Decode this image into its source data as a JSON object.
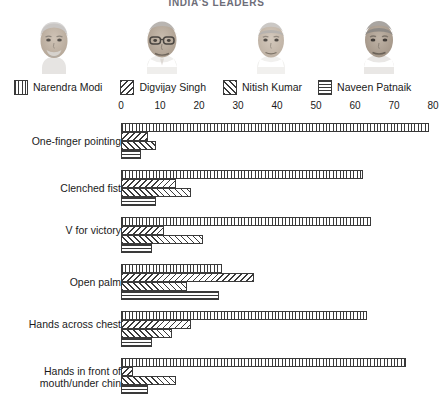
{
  "chart_title": "INDIA'S LEADERS",
  "legend": {
    "items": [
      {
        "label": "Narendra Modi",
        "pattern": "vertical-lines",
        "swatch_name": "legend-swatch-modi"
      },
      {
        "label": "Digvijay Singh",
        "pattern": "backslash-hatch",
        "swatch_name": "legend-swatch-singh"
      },
      {
        "label": "Nitish Kumar",
        "pattern": "forwardslash-hatch",
        "swatch_name": "legend-swatch-kumar"
      },
      {
        "label": "Naveen Patnaik",
        "pattern": "horizontal-lines",
        "swatch_name": "legend-swatch-patnaik"
      }
    ]
  },
  "portraits": [
    {
      "name": "Narendra Modi"
    },
    {
      "name": "Digvijay Singh"
    },
    {
      "name": "Nitish Kumar"
    },
    {
      "name": "Naveen Patnaik"
    }
  ],
  "chart_data": {
    "type": "bar",
    "orientation": "horizontal",
    "title": "INDIA'S LEADERS",
    "xlabel": "",
    "ylabel": "",
    "xlim": [
      0,
      80
    ],
    "xticks": [
      0,
      10,
      20,
      30,
      40,
      50,
      60,
      70,
      80
    ],
    "grid": false,
    "legend_position": "top",
    "categories": [
      "One-finger pointing",
      "Clenched fist",
      "V for victory",
      "Open palm",
      "Hands across chest",
      "Hands in front of mouth/under chin"
    ],
    "series": [
      {
        "name": "Narendra Modi",
        "pattern": "vertical-lines",
        "values": [
          79,
          62,
          64,
          26,
          63,
          73
        ]
      },
      {
        "name": "Digvijay Singh",
        "pattern": "backslash-hatch",
        "values": [
          7,
          14,
          11,
          34,
          18,
          3
        ]
      },
      {
        "name": "Nitish Kumar",
        "pattern": "forwardslash-hatch",
        "values": [
          9,
          18,
          21,
          17,
          13,
          14
        ]
      },
      {
        "name": "Naveen Patnaik",
        "pattern": "horizontal-lines",
        "values": [
          5,
          9,
          8,
          25,
          8,
          7
        ]
      }
    ]
  }
}
